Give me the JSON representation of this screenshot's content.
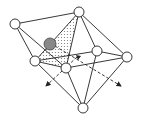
{
  "diagram": {
    "type": "octahedral-cluster-with-interstitial",
    "colors": {
      "stroke": "#222222",
      "node_fill": "#ffffff",
      "interstitial_fill": "#888888",
      "shading": "#999999"
    },
    "nodes": [
      {
        "id": "top",
        "x": 79,
        "y": 12,
        "r": 5
      },
      {
        "id": "left",
        "x": 15,
        "y": 24,
        "r": 5
      },
      {
        "id": "right-mid",
        "x": 97,
        "y": 51,
        "r": 5
      },
      {
        "id": "far-right",
        "x": 127,
        "y": 57,
        "r": 5
      },
      {
        "id": "left-mid",
        "x": 35,
        "y": 61,
        "r": 5
      },
      {
        "id": "center",
        "x": 66,
        "y": 68,
        "r": 5
      },
      {
        "id": "bottom",
        "x": 83,
        "y": 108,
        "r": 5
      }
    ],
    "interstitial": {
      "x": 50,
      "y": 44,
      "r": 6
    },
    "arrows": [
      {
        "id": "left-arrow",
        "from": [
          77,
          57
        ],
        "to": [
          45,
          87
        ]
      },
      {
        "id": "right-arrow",
        "from": [
          50,
          44
        ],
        "to": [
          122,
          87
        ]
      }
    ]
  }
}
